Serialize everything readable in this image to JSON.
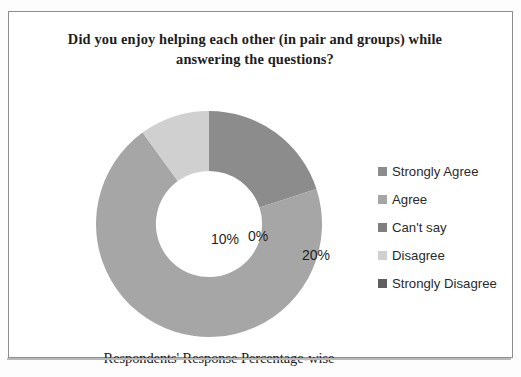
{
  "figure": {
    "title": "Did you enjoy helping each other (in pair and groups) while\nanswering the questions?",
    "caption": "Respondents' Response Percentage-wise"
  },
  "legend": {
    "position": "right",
    "items": [
      {
        "label": "Strongly Agree",
        "color": "#8c8c8c"
      },
      {
        "label": "Agree",
        "color": "#a6a6a6"
      },
      {
        "label": "Can't say",
        "color": "#7f7f7f"
      },
      {
        "label": "Disagree",
        "color": "#d0d0d0"
      },
      {
        "label": "Strongly Disagree",
        "color": "#5e5e5e"
      }
    ]
  },
  "labels": {
    "strongly_agree": "20%",
    "agree": "10%",
    "cant_say": "0%",
    "disagree": "70%"
  },
  "chart_data": {
    "type": "pie",
    "variant": "doughnut",
    "title": "Did you enjoy helping each other (in pair and groups) while answering the questions?",
    "subtitle": "Respondents' Response Percentage-wise",
    "xlabel": "",
    "ylabel": "",
    "unit": "percent",
    "hole_ratio": 0.47,
    "start_angle_deg": 0,
    "direction": "clockwise",
    "grid": false,
    "legend_position": "right",
    "categories": [
      "Strongly Agree",
      "Agree",
      "Can't say",
      "Disagree",
      "Strongly Disagree"
    ],
    "values": [
      20,
      70,
      0,
      10,
      0
    ],
    "data_labels": [
      "20%",
      "70%",
      "0%",
      "10%",
      ""
    ],
    "colors": [
      "#8c8c8c",
      "#a6a6a6",
      "#7f7f7f",
      "#d0d0d0",
      "#5e5e5e"
    ],
    "slices": [
      {
        "name": "Strongly Agree",
        "value": 20,
        "label": "20%",
        "color": "#8c8c8c",
        "start_deg": 0,
        "end_deg": 72
      },
      {
        "name": "Agree",
        "value": 70,
        "label": "70%",
        "color": "#a6a6a6",
        "start_deg": 72,
        "end_deg": 324
      },
      {
        "name": "Can't say",
        "value": 0,
        "label": "0%",
        "color": "#7f7f7f",
        "start_deg": 324,
        "end_deg": 324
      },
      {
        "name": "Disagree",
        "value": 10,
        "label": "10%",
        "color": "#d0d0d0",
        "start_deg": 324,
        "end_deg": 360
      },
      {
        "name": "Strongly Disagree",
        "value": 0,
        "label": "",
        "color": "#5e5e5e",
        "start_deg": 360,
        "end_deg": 360
      }
    ]
  }
}
